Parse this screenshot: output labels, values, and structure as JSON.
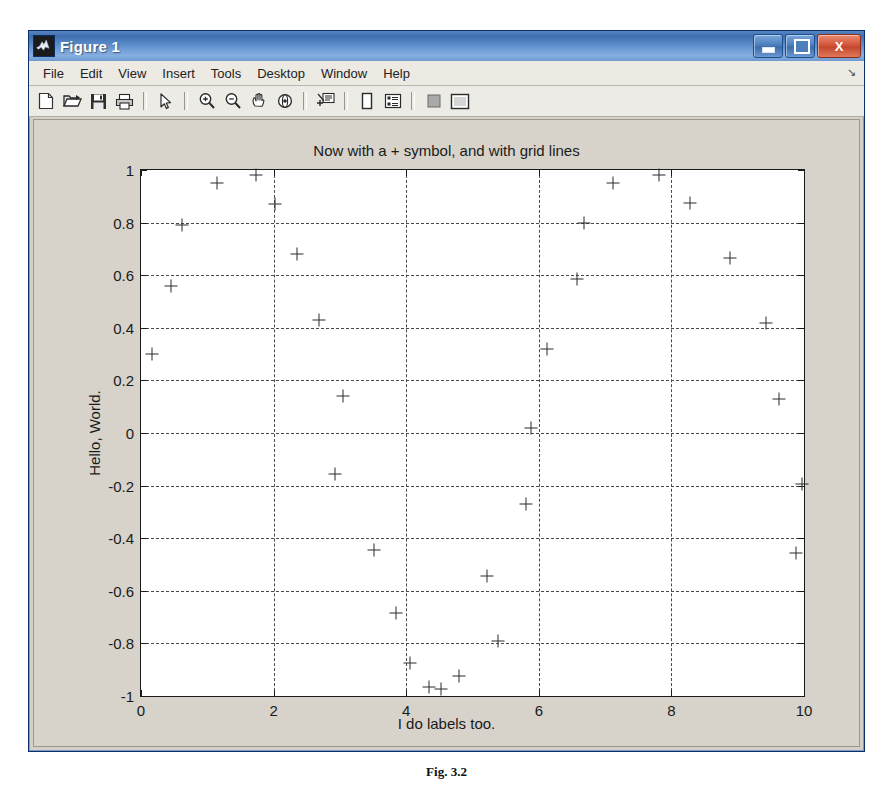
{
  "window": {
    "title": "Figure 1",
    "icon": "matlab-logo-icon",
    "controls": [
      {
        "name": "minimize-button",
        "glyph": "minimize"
      },
      {
        "name": "maximize-button",
        "glyph": "maximize"
      },
      {
        "name": "close-button",
        "glyph": "X"
      }
    ]
  },
  "menubar": {
    "items": [
      {
        "label": "File"
      },
      {
        "label": "Edit"
      },
      {
        "label": "View"
      },
      {
        "label": "Insert"
      },
      {
        "label": "Tools"
      },
      {
        "label": "Desktop"
      },
      {
        "label": "Window"
      },
      {
        "label": "Help"
      }
    ],
    "overflow_arrow": "↘"
  },
  "toolbar": {
    "buttons": [
      {
        "name": "new-figure-icon",
        "tooltip": "New Figure"
      },
      {
        "name": "open-file-icon",
        "tooltip": "Open File"
      },
      {
        "name": "save-figure-icon",
        "tooltip": "Save Figure"
      },
      {
        "name": "print-figure-icon",
        "tooltip": "Print Figure"
      },
      {
        "name": "pointer-arrow-icon",
        "tooltip": "Edit Plot"
      },
      {
        "name": "zoom-in-icon",
        "tooltip": "Zoom In"
      },
      {
        "name": "zoom-out-icon",
        "tooltip": "Zoom Out"
      },
      {
        "name": "pan-hand-icon",
        "tooltip": "Pan"
      },
      {
        "name": "rotate-3d-icon",
        "tooltip": "Rotate 3D"
      },
      {
        "name": "data-cursor-icon",
        "tooltip": "Data Cursor"
      },
      {
        "name": "insert-colorbar-icon",
        "tooltip": "Insert Colorbar"
      },
      {
        "name": "insert-legend-icon",
        "tooltip": "Insert Legend"
      },
      {
        "name": "hide-plot-tools-icon",
        "tooltip": "Hide Plot Tools"
      },
      {
        "name": "show-plot-tools-icon",
        "tooltip": "Show Plot Tools and Dock Figure"
      }
    ]
  },
  "figure": {
    "background_color": "#d7d3ca",
    "axes_background_color": "#ffffff"
  },
  "caption": "Fig. 3.2",
  "chart_data": {
    "type": "scatter",
    "title": "Now with a + symbol, and with grid lines",
    "xlabel": "I do labels too.",
    "ylabel": "Hello, World.",
    "marker": "+",
    "marker_color": "#2b2b2b",
    "grid": true,
    "grid_style": "dashed",
    "legend": null,
    "xlim": [
      0,
      10
    ],
    "ylim": [
      -1,
      1
    ],
    "xticks": [
      0,
      2,
      4,
      6,
      8,
      10
    ],
    "yticks": [
      1,
      0.8,
      0.6,
      0.4,
      0.2,
      0,
      -0.2,
      -0.4,
      -0.6,
      -0.8,
      -1
    ],
    "xticklabels": [
      "0",
      "2",
      "4",
      "6",
      "8",
      "10"
    ],
    "yticklabels": [
      "1",
      "0.8",
      "0.6",
      "0.4",
      "0.2",
      "0",
      "-0.2",
      "-0.4",
      "-0.6",
      "-0.8",
      "-1"
    ],
    "points": [
      {
        "x": 0.17,
        "y": 0.3
      },
      {
        "x": 0.45,
        "y": 0.56
      },
      {
        "x": 0.62,
        "y": 0.79
      },
      {
        "x": 1.15,
        "y": 0.95
      },
      {
        "x": 1.73,
        "y": 0.98
      },
      {
        "x": 2.02,
        "y": 0.87
      },
      {
        "x": 2.35,
        "y": 0.68
      },
      {
        "x": 2.68,
        "y": 0.43
      },
      {
        "x": 3.05,
        "y": 0.14
      },
      {
        "x": 2.93,
        "y": -0.155
      },
      {
        "x": 3.52,
        "y": -0.445
      },
      {
        "x": 3.85,
        "y": -0.685
      },
      {
        "x": 4.05,
        "y": -0.875
      },
      {
        "x": 4.35,
        "y": -0.965
      },
      {
        "x": 4.52,
        "y": -0.975
      },
      {
        "x": 4.8,
        "y": -0.925
      },
      {
        "x": 5.22,
        "y": -0.545
      },
      {
        "x": 5.38,
        "y": -0.79
      },
      {
        "x": 5.8,
        "y": -0.27
      },
      {
        "x": 5.88,
        "y": 0.02
      },
      {
        "x": 6.12,
        "y": 0.32
      },
      {
        "x": 6.57,
        "y": 0.585
      },
      {
        "x": 6.68,
        "y": 0.8
      },
      {
        "x": 7.12,
        "y": 0.95
      },
      {
        "x": 7.82,
        "y": 0.98
      },
      {
        "x": 8.28,
        "y": 0.875
      },
      {
        "x": 8.88,
        "y": 0.665
      },
      {
        "x": 9.42,
        "y": 0.42
      },
      {
        "x": 9.63,
        "y": 0.13
      },
      {
        "x": 9.97,
        "y": -0.195
      },
      {
        "x": 9.88,
        "y": -0.455
      }
    ]
  }
}
